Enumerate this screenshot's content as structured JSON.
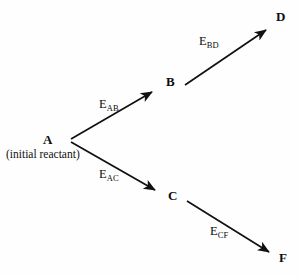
{
  "diagram": {
    "type": "reaction-pathway-branching-diagram",
    "background_color": "#fefefe",
    "stroke_color": "#111111",
    "nodes": [
      {
        "id": "A",
        "label": "A",
        "caption": "(initial reactant)",
        "x": 47,
        "y": 140
      },
      {
        "id": "B",
        "label": "B",
        "caption": "",
        "x": 170,
        "y": 82
      },
      {
        "id": "C",
        "label": "C",
        "caption": "",
        "x": 172,
        "y": 196
      },
      {
        "id": "D",
        "label": "D",
        "caption": "",
        "x": 280,
        "y": 17
      },
      {
        "id": "F",
        "label": "F",
        "caption": "",
        "x": 283,
        "y": 258
      }
    ],
    "edges": [
      {
        "id": "AB",
        "from": "A",
        "to": "B",
        "label_e": "E",
        "label_sub": "AB",
        "label_x": 99,
        "label_y": 105
      },
      {
        "id": "AC",
        "from": "A",
        "to": "C",
        "label_e": "E",
        "label_sub": "AC",
        "label_x": 99,
        "label_y": 175
      },
      {
        "id": "BD",
        "from": "B",
        "to": "D",
        "label_e": "E",
        "label_sub": "BD",
        "label_x": 199,
        "label_y": 42
      },
      {
        "id": "CF",
        "from": "C",
        "to": "F",
        "label_e": "E",
        "label_sub": "CF",
        "label_x": 210,
        "label_y": 232
      }
    ]
  }
}
